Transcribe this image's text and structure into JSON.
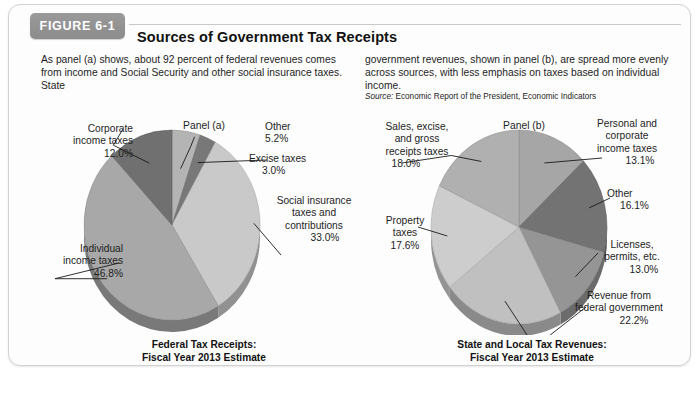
{
  "figure": {
    "badge": "FIGURE 6-1",
    "title": "Sources of Government Tax Receipts",
    "intro_left": "As panel (a) shows, about 92 percent of federal revenues comes from income and Social Security and other social insurance taxes. State",
    "intro_right": "government revenues, shown in panel (b), are spread more evenly across sources, with less emphasis on taxes based on individual income.",
    "source_label": "Source:",
    "source_text": "Economic Report of the President, Economic Indicators"
  },
  "panel_a": {
    "panel_label": "Panel (a)",
    "caption_line1": "Federal Tax Receipts:",
    "caption_line2": "Fiscal Year 2013 Estimate"
  },
  "panel_b": {
    "panel_label": "Panel (b)",
    "caption_line1": "State and Local Tax Revenues:",
    "caption_line2": "Fiscal Year 2013 Estimate"
  },
  "chart_data": [
    {
      "type": "pie",
      "title": "Federal Tax Receipts: Fiscal Year 2013 Estimate",
      "panel": "Panel (a)",
      "legend": "labels-with-leader-lines",
      "categories": [
        "Other",
        "Excise taxes",
        "Social insurance taxes and contributions",
        "Individual income taxes",
        "Corporate income taxes"
      ],
      "values": [
        5.2,
        3.0,
        33.0,
        46.8,
        12.0
      ],
      "value_labels": [
        "5.2%",
        "3.0%",
        "33.0%",
        "46.8%",
        "12.0%"
      ],
      "colors": [
        "#b4b4b4",
        "#787878",
        "#c9c9c9",
        "#a8a8a8",
        "#707070"
      ],
      "labels": [
        {
          "name": "Other",
          "value": "5.2%",
          "line1": "Other",
          "line2": "5.2%"
        },
        {
          "name": "Excise taxes",
          "value": "3.0%",
          "line1": "Excise taxes",
          "line2": "3.0%"
        },
        {
          "name": "Social insurance taxes and contributions",
          "value": "33.0%",
          "line1": "Social insurance",
          "line2": "taxes and",
          "line3": "contributions",
          "line4": "33.0%"
        },
        {
          "name": "Individual income taxes",
          "value": "46.8%",
          "line1": "Individual",
          "line2": "income taxes",
          "line3": "46.8%"
        },
        {
          "name": "Corporate income taxes",
          "value": "12.0%",
          "line1": "Corporate",
          "line2": "income taxes",
          "line3": "12.0%"
        }
      ]
    },
    {
      "type": "pie",
      "title": "State and Local Tax Revenues: Fiscal Year 2013 Estimate",
      "panel": "Panel (b)",
      "legend": "labels-with-leader-lines",
      "categories": [
        "Personal and corporate income taxes",
        "Other",
        "Licenses, permits, etc.",
        "Revenue from federal government",
        "Property taxes",
        "Sales, excise, and gross receipts taxes"
      ],
      "values": [
        13.1,
        16.1,
        13.0,
        22.2,
        17.6,
        18.0
      ],
      "value_labels": [
        "13.1%",
        "16.1%",
        "13.0%",
        "22.2%",
        "17.6%",
        "18.0%"
      ],
      "colors": [
        "#a6a6a6",
        "#737373",
        "#959595",
        "#c0c0c0",
        "#cdcdcd",
        "#b0b0b0"
      ],
      "labels": [
        {
          "name": "Personal and corporate income taxes",
          "value": "13.1%",
          "line1": "Personal and",
          "line2": "corporate",
          "line3": "income taxes",
          "line4": "13.1%"
        },
        {
          "name": "Other",
          "value": "16.1%",
          "line1": "Other",
          "line2": "16.1%"
        },
        {
          "name": "Licenses, permits, etc.",
          "value": "13.0%",
          "line1": "Licenses,",
          "line2": "permits, etc.",
          "line3": "13.0%"
        },
        {
          "name": "Revenue from federal government",
          "value": "22.2%",
          "line1": "Revenue from",
          "line2": "federal government",
          "line3": "22.2%"
        },
        {
          "name": "Property taxes",
          "value": "17.6%",
          "line1": "Property",
          "line2": "taxes",
          "line3": "17.6%"
        },
        {
          "name": "Sales, excise, and gross receipts taxes",
          "value": "18.0%",
          "line1": "Sales, excise,",
          "line2": "and gross",
          "line3": "receipts taxes",
          "line4": "18.0%"
        }
      ]
    }
  ]
}
